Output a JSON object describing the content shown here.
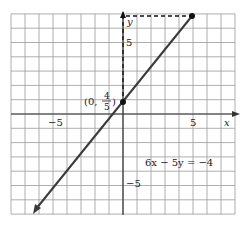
{
  "chart_data": {
    "type": "line",
    "title": "",
    "xlabel": "x",
    "ylabel": "y",
    "xlim": [
      -8,
      8
    ],
    "ylim": [
      -7,
      7
    ],
    "grid": true,
    "x_ticks_labeled": [
      -5,
      5
    ],
    "y_ticks_labeled": [
      5,
      -5
    ],
    "tick_labels": {
      "x_neg": "−5",
      "x_pos": "5",
      "y_pos": "5",
      "y_neg": "−5"
    },
    "series": [
      {
        "name": "6x − 5y = −4",
        "equation": "6x − 5y = −4",
        "slope": 1.2,
        "intercept": 0.8,
        "x": [
          -6.5,
          5
        ],
        "y": [
          -7,
          6.8
        ],
        "arrow_start": true
      }
    ],
    "points": [
      {
        "label": "(0, 4/5)",
        "x": 0,
        "y": 0.8
      },
      {
        "label": "",
        "x": 5,
        "y": 6.8
      }
    ],
    "annotations": [
      {
        "text": "6x − 5y = −4",
        "x": 1.0,
        "y": -2.4
      },
      {
        "text": "dashed guide",
        "from": [
          0,
          0.8
        ],
        "to": [
          0,
          6.8
        ],
        "style": "dashed"
      },
      {
        "text": "dashed guide",
        "from": [
          0,
          6.8
        ],
        "to": [
          5,
          6.8
        ],
        "style": "dashed"
      }
    ]
  },
  "labels": {
    "x_axis": "x",
    "y_axis": "y",
    "x_neg5": "−5",
    "x_pos5": "5",
    "y_pos5": "5",
    "y_neg5": "−5",
    "point_prefix": "(0,",
    "point_num": "4",
    "point_den": "5",
    "point_suffix": ")",
    "equation": "6x − 5y = −4"
  },
  "colors": {
    "grid": "#9a9a9a",
    "axis": "#333333",
    "line": "#3a3a3a",
    "point": "#111111"
  }
}
